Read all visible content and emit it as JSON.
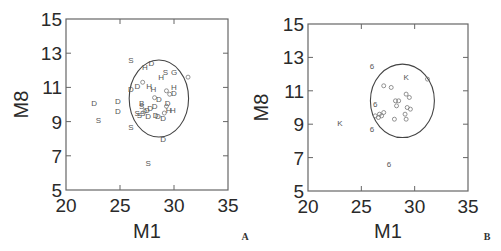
{
  "chart_data": [
    {
      "panel": "A",
      "type": "scatter",
      "title": "",
      "xlabel": "M1",
      "ylabel": "M8",
      "xlim": [
        20,
        35
      ],
      "ylim": [
        5,
        15
      ],
      "xticks": [
        "20",
        "25",
        "30",
        "35"
      ],
      "yticks": [
        "5",
        "7",
        "9",
        "11",
        "13",
        "15"
      ],
      "grid": false,
      "legend": null,
      "ellipse": {
        "cx": 28.6,
        "cy": 10.35,
        "rx": 2.75,
        "ry": 2.25
      },
      "points": [
        {
          "x": 26.0,
          "y": 12.6,
          "label": "S"
        },
        {
          "x": 27.3,
          "y": 12.2,
          "label": "H"
        },
        {
          "x": 27.9,
          "y": 12.4,
          "label": "D"
        },
        {
          "x": 29.2,
          "y": 11.9,
          "label": "S"
        },
        {
          "x": 30.0,
          "y": 11.9,
          "label": "G"
        },
        {
          "x": 28.8,
          "y": 11.6,
          "label": "H"
        },
        {
          "x": 31.3,
          "y": 11.6,
          "label": "o"
        },
        {
          "x": 26.0,
          "y": 10.9,
          "label": "D"
        },
        {
          "x": 26.6,
          "y": 11.1,
          "label": "D"
        },
        {
          "x": 27.1,
          "y": 11.3,
          "label": "o"
        },
        {
          "x": 27.7,
          "y": 11.1,
          "label": "H"
        },
        {
          "x": 28.1,
          "y": 10.9,
          "label": "H"
        },
        {
          "x": 30.0,
          "y": 11.0,
          "label": "H"
        },
        {
          "x": 30.0,
          "y": 10.7,
          "label": "D"
        },
        {
          "x": 29.3,
          "y": 10.8,
          "label": "o"
        },
        {
          "x": 29.6,
          "y": 10.6,
          "label": "o"
        },
        {
          "x": 22.6,
          "y": 10.1,
          "label": "D"
        },
        {
          "x": 23.0,
          "y": 9.1,
          "label": "S"
        },
        {
          "x": 24.8,
          "y": 10.2,
          "label": "D"
        },
        {
          "x": 24.8,
          "y": 9.6,
          "label": "D"
        },
        {
          "x": 26.0,
          "y": 8.7,
          "label": "S"
        },
        {
          "x": 27.0,
          "y": 10.1,
          "label": "B"
        },
        {
          "x": 27.0,
          "y": 9.9,
          "label": "S"
        },
        {
          "x": 28.2,
          "y": 10.4,
          "label": "o"
        },
        {
          "x": 28.6,
          "y": 10.3,
          "label": "D"
        },
        {
          "x": 29.4,
          "y": 10.1,
          "label": "D"
        },
        {
          "x": 26.6,
          "y": 9.5,
          "label": "S"
        },
        {
          "x": 26.8,
          "y": 9.4,
          "label": "S"
        },
        {
          "x": 27.1,
          "y": 9.5,
          "label": "S"
        },
        {
          "x": 27.3,
          "y": 9.6,
          "label": "o"
        },
        {
          "x": 27.5,
          "y": 9.7,
          "label": "D"
        },
        {
          "x": 27.8,
          "y": 9.8,
          "label": "D"
        },
        {
          "x": 28.2,
          "y": 9.9,
          "label": "D"
        },
        {
          "x": 29.3,
          "y": 9.9,
          "label": "o"
        },
        {
          "x": 27.6,
          "y": 9.3,
          "label": "D"
        },
        {
          "x": 28.3,
          "y": 9.4,
          "label": "D"
        },
        {
          "x": 28.5,
          "y": 9.3,
          "label": "D"
        },
        {
          "x": 29.0,
          "y": 9.2,
          "label": "D"
        },
        {
          "x": 29.1,
          "y": 9.5,
          "label": "o"
        },
        {
          "x": 29.5,
          "y": 9.7,
          "label": "H"
        },
        {
          "x": 29.9,
          "y": 9.7,
          "label": "H"
        },
        {
          "x": 29.0,
          "y": 8.0,
          "label": "D"
        },
        {
          "x": 27.6,
          "y": 6.6,
          "label": "S"
        }
      ],
      "panel_label": "A"
    },
    {
      "panel": "B",
      "type": "scatter",
      "title": "",
      "xlabel": "M1",
      "ylabel": "M8",
      "xlim": [
        20,
        35
      ],
      "ylim": [
        5,
        15
      ],
      "xticks": [
        "20",
        "25",
        "30",
        "35"
      ],
      "yticks": [
        "5",
        "7",
        "9",
        "11",
        "13",
        "15"
      ],
      "grid": false,
      "legend": null,
      "ellipse": {
        "cx": 28.85,
        "cy": 10.4,
        "rx": 3.0,
        "ry": 2.2
      },
      "points": [
        {
          "x": 26.0,
          "y": 12.5,
          "label": "6"
        },
        {
          "x": 29.2,
          "y": 11.8,
          "label": "K"
        },
        {
          "x": 31.2,
          "y": 11.7,
          "label": "o"
        },
        {
          "x": 27.1,
          "y": 11.3,
          "label": "o"
        },
        {
          "x": 27.8,
          "y": 11.2,
          "label": "o"
        },
        {
          "x": 29.2,
          "y": 10.8,
          "label": "o"
        },
        {
          "x": 29.5,
          "y": 10.6,
          "label": "o"
        },
        {
          "x": 28.2,
          "y": 10.4,
          "label": "o"
        },
        {
          "x": 28.5,
          "y": 10.4,
          "label": "o"
        },
        {
          "x": 28.3,
          "y": 10.1,
          "label": "o"
        },
        {
          "x": 29.3,
          "y": 10.0,
          "label": "o"
        },
        {
          "x": 29.6,
          "y": 9.9,
          "label": "o"
        },
        {
          "x": 26.3,
          "y": 10.2,
          "label": "6"
        },
        {
          "x": 27.1,
          "y": 9.7,
          "label": "o"
        },
        {
          "x": 26.9,
          "y": 9.5,
          "label": "o"
        },
        {
          "x": 26.6,
          "y": 9.4,
          "label": "o"
        },
        {
          "x": 26.3,
          "y": 9.5,
          "label": "o"
        },
        {
          "x": 26.7,
          "y": 9.6,
          "label": "o"
        },
        {
          "x": 29.1,
          "y": 9.6,
          "label": "o"
        },
        {
          "x": 28.1,
          "y": 9.3,
          "label": "o"
        },
        {
          "x": 29.2,
          "y": 9.3,
          "label": "o"
        },
        {
          "x": 23.0,
          "y": 9.1,
          "label": "K"
        },
        {
          "x": 26.0,
          "y": 8.7,
          "label": "6"
        },
        {
          "x": 27.6,
          "y": 6.6,
          "label": "6"
        }
      ],
      "panel_label": "B"
    }
  ],
  "panels": [
    {
      "label": "A",
      "xlabel": "M1",
      "ylabel": "M8"
    },
    {
      "label": "B",
      "xlabel": "M1",
      "ylabel": "M8"
    }
  ]
}
